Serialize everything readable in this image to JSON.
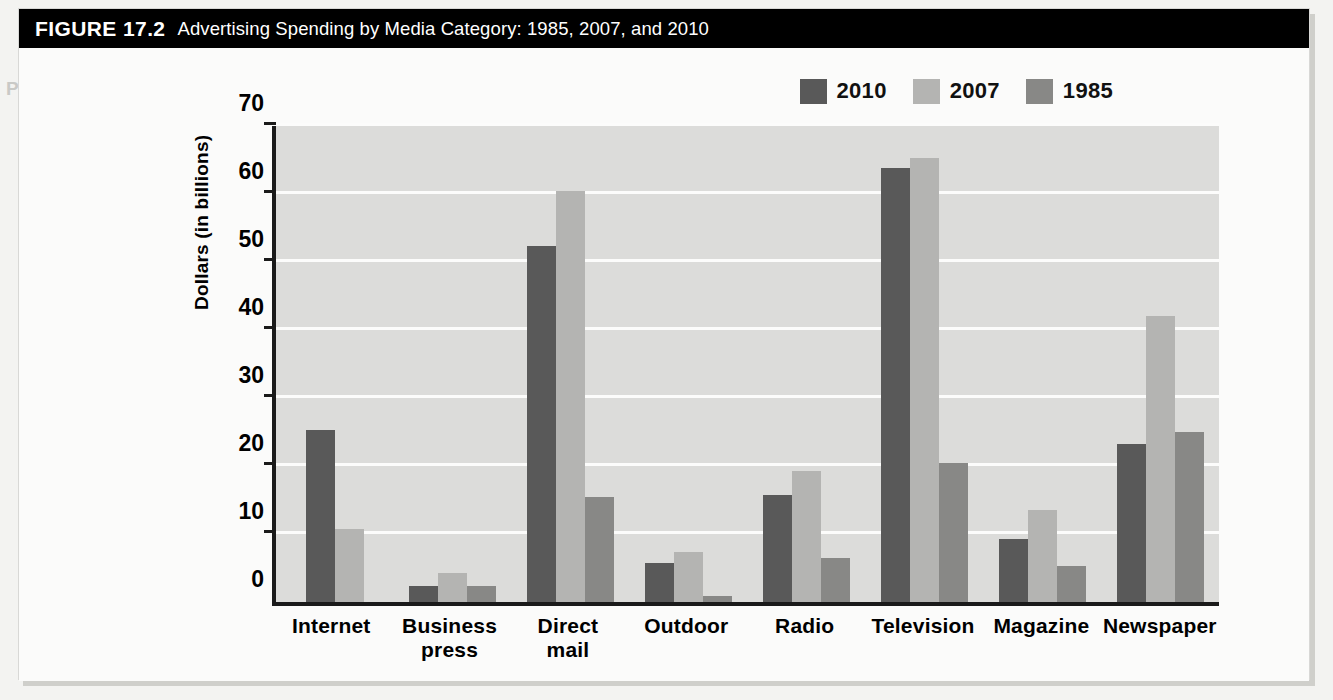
{
  "figure": {
    "number": "FIGURE 17.2",
    "title": "Advertising Spending by Media Category: 1985, 2007, and 2010"
  },
  "colors": {
    "series_2010": "#595959",
    "series_2007": "#b4b4b2",
    "series_1985": "#888886",
    "plot_background": "#dcdcda",
    "gridline": "#fcfcfb",
    "axis": "#1a1a1a",
    "header_background": "#000000",
    "header_text": "#ffffff"
  },
  "chart_data": {
    "type": "bar",
    "title": "Advertising Spending by Media Category: 1985, 2007, and 2010",
    "xlabel": "",
    "ylabel": "Dollars (in billions)",
    "ylim": [
      0,
      70
    ],
    "yticks": [
      0,
      10,
      20,
      30,
      40,
      50,
      60,
      70
    ],
    "ytick_labels": [
      "0",
      "10",
      "20",
      "30",
      "40",
      "50",
      "60",
      "70"
    ],
    "grid": true,
    "legend_position": "top-right",
    "categories": [
      "Internet",
      "Business press",
      "Direct mail",
      "Outdoor",
      "Radio",
      "Television",
      "Magazine",
      "Newspaper"
    ],
    "category_label_lines": [
      [
        "Internet"
      ],
      [
        "Business",
        "press"
      ],
      [
        "Direct",
        "mail"
      ],
      [
        "Outdoor"
      ],
      [
        "Radio"
      ],
      [
        "Television"
      ],
      [
        "Magazine"
      ],
      [
        "Newspaper"
      ]
    ],
    "series": [
      {
        "name": "2010",
        "color": "#595959",
        "values": [
          25.3,
          2.4,
          52.3,
          5.7,
          15.8,
          63.8,
          9.2,
          23.3
        ]
      },
      {
        "name": "2007",
        "color": "#b4b4b2",
        "values": [
          10.7,
          4.2,
          60.4,
          7.4,
          19.2,
          65.3,
          13.6,
          42.0
        ]
      },
      {
        "name": "1985",
        "color": "#888886",
        "values": [
          null,
          2.4,
          15.5,
          0.9,
          6.5,
          20.5,
          5.3,
          25.0
        ]
      }
    ]
  },
  "legend": {
    "entries": [
      {
        "label": "2010",
        "color": "#595959"
      },
      {
        "label": "2007",
        "color": "#b4b4b2"
      },
      {
        "label": "1985",
        "color": "#888886"
      }
    ]
  },
  "background_bleed": {
    "note": "faint reverse-side table text visible through the page",
    "lines": [
      "Percent Change",
      "(Millions)",
      "Jan. Sep. 2007",
      "Jan. Sep. 2006",
      "(Millions)"
    ]
  }
}
